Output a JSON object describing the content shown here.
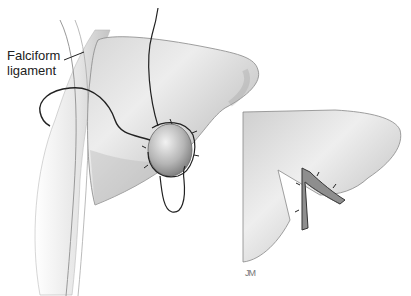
{
  "figure": {
    "annotation": {
      "line1": "Falciform",
      "line2": "ligament"
    },
    "signature": "JM",
    "colors": {
      "organ_light": "#ececec",
      "organ_mid": "#c8c8c8",
      "organ_dark": "#8a8a8a",
      "suture": "#222222",
      "background": "#ffffff"
    }
  }
}
